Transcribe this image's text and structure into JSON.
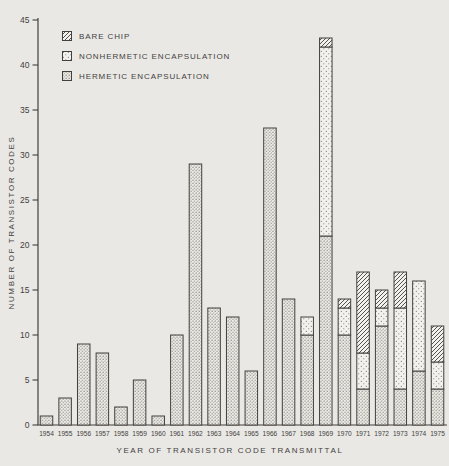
{
  "figure": {
    "background_color": "#e9e8e5",
    "ink_color": "#44413c",
    "bar_fill_color": "#f3f1ed"
  },
  "chart_data": {
    "type": "bar",
    "stacked": true,
    "title": "",
    "xlabel": "YEAR OF TRANSISTOR CODE TRANSMITTAL",
    "ylabel": "NUMBER OF TRANSISTOR CODES",
    "ylim": [
      0,
      45
    ],
    "yticks": [
      0,
      5,
      10,
      15,
      20,
      25,
      30,
      35,
      40,
      45
    ],
    "grid": false,
    "legend_position": "top-left",
    "categories": [
      "1954",
      "1955",
      "1956",
      "1957",
      "1958",
      "1959",
      "1960",
      "1961",
      "1962",
      "1963",
      "1964",
      "1965",
      "1966",
      "1967",
      "1968",
      "1969",
      "1970",
      "1971",
      "1972",
      "1973",
      "1974",
      "1975"
    ],
    "series": [
      {
        "name": "HERMETIC ENCAPSULATION",
        "pattern": "dots-dense",
        "values": [
          1,
          3,
          9,
          8,
          2,
          5,
          1,
          10,
          29,
          13,
          12,
          6,
          33,
          14,
          10,
          21,
          10,
          4,
          11,
          4,
          6,
          4
        ]
      },
      {
        "name": "NONHERMETIC ENCAPSULATION",
        "pattern": "dots-light",
        "values": [
          0,
          0,
          0,
          0,
          0,
          0,
          0,
          0,
          0,
          0,
          0,
          0,
          0,
          0,
          2,
          21,
          3,
          4,
          2,
          9,
          10,
          3
        ]
      },
      {
        "name": "BARE CHIP",
        "pattern": "hatch",
        "values": [
          0,
          0,
          0,
          0,
          0,
          0,
          0,
          0,
          0,
          0,
          0,
          0,
          0,
          0,
          0,
          1,
          1,
          9,
          2,
          4,
          0,
          4
        ]
      }
    ],
    "totals": [
      1,
      3,
      9,
      8,
      2,
      5,
      1,
      10,
      29,
      13,
      12,
      6,
      33,
      14,
      12,
      43,
      14,
      17,
      15,
      17,
      16,
      11
    ]
  },
  "legend": {
    "entries": [
      {
        "label": "BARE CHIP",
        "pattern": "hatch"
      },
      {
        "label": "NONHERMETIC ENCAPSULATION",
        "pattern": "dots-light"
      },
      {
        "label": "HERMETIC ENCAPSULATION",
        "pattern": "dots-dense"
      }
    ]
  }
}
